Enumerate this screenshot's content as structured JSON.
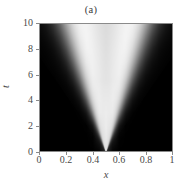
{
  "figure": {
    "panel_label": "(a)",
    "background_color": "#ffffff",
    "axis_color": "#8a8a8a",
    "text_color": "#4a4a4a"
  },
  "axes": {
    "xlabel": "x",
    "ylabel": "t",
    "xticks": [
      "0",
      "0.2",
      "0.4",
      "0.6",
      "0.8",
      "1"
    ],
    "xtick_values": [
      0,
      0.2,
      0.4,
      0.6,
      0.8,
      1
    ],
    "yticks": [
      "0",
      "2",
      "4",
      "6",
      "8",
      "10"
    ],
    "ytick_values": [
      0,
      2,
      4,
      6,
      8,
      10
    ],
    "xlim": [
      0,
      1
    ],
    "ylim": [
      0,
      10
    ]
  },
  "chart_data": {
    "type": "heatmap",
    "title": "(a)",
    "xlabel": "x",
    "ylabel": "t",
    "xlim": [
      0,
      1
    ],
    "ylim": [
      0,
      10
    ],
    "grid": false,
    "legend": "none",
    "colormap": "gray",
    "colormap_low": "#000000",
    "colormap_high": "#ffffff",
    "value_range": [
      0,
      1
    ],
    "apex": {
      "x": 0.5,
      "t": 0.0
    },
    "cone_half_width_slope": 0.038,
    "x": [
      0,
      0.05,
      0.1,
      0.15,
      0.2,
      0.25,
      0.3,
      0.35,
      0.4,
      0.45,
      0.5,
      0.55,
      0.6,
      0.65,
      0.7,
      0.75,
      0.8,
      0.85,
      0.9,
      0.95,
      1
    ],
    "t": [
      0,
      1,
      2,
      3,
      4,
      5,
      6,
      7,
      8,
      9,
      10
    ],
    "z": [
      [
        0.0,
        0.0,
        0.0,
        0.0,
        0.0,
        0.0,
        0.0,
        0.0,
        0.0,
        0.05,
        0.55,
        0.05,
        0.0,
        0.0,
        0.0,
        0.0,
        0.0,
        0.0,
        0.0,
        0.0,
        0.0
      ],
      [
        0.0,
        0.0,
        0.0,
        0.0,
        0.0,
        0.0,
        0.0,
        0.0,
        0.02,
        0.3,
        0.75,
        0.3,
        0.02,
        0.0,
        0.0,
        0.0,
        0.0,
        0.0,
        0.0,
        0.0,
        0.0
      ],
      [
        0.0,
        0.0,
        0.0,
        0.0,
        0.0,
        0.0,
        0.0,
        0.01,
        0.12,
        0.55,
        0.88,
        0.55,
        0.12,
        0.01,
        0.0,
        0.0,
        0.0,
        0.0,
        0.0,
        0.0,
        0.0
      ],
      [
        0.0,
        0.0,
        0.0,
        0.0,
        0.0,
        0.0,
        0.01,
        0.08,
        0.38,
        0.78,
        0.95,
        0.78,
        0.38,
        0.08,
        0.01,
        0.0,
        0.0,
        0.0,
        0.0,
        0.0,
        0.0
      ],
      [
        0.0,
        0.0,
        0.0,
        0.0,
        0.0,
        0.01,
        0.06,
        0.26,
        0.62,
        0.9,
        0.98,
        0.9,
        0.62,
        0.26,
        0.06,
        0.01,
        0.0,
        0.0,
        0.0,
        0.0,
        0.0
      ],
      [
        0.0,
        0.0,
        0.0,
        0.0,
        0.01,
        0.04,
        0.18,
        0.48,
        0.8,
        0.96,
        1.0,
        0.96,
        0.8,
        0.48,
        0.18,
        0.04,
        0.01,
        0.0,
        0.0,
        0.0,
        0.0
      ],
      [
        0.0,
        0.0,
        0.0,
        0.01,
        0.03,
        0.13,
        0.36,
        0.68,
        0.92,
        1.0,
        0.99,
        1.0,
        0.92,
        0.68,
        0.36,
        0.13,
        0.03,
        0.01,
        0.0,
        0.0,
        0.0
      ],
      [
        0.0,
        0.0,
        0.01,
        0.02,
        0.09,
        0.28,
        0.56,
        0.84,
        0.98,
        1.0,
        0.96,
        1.0,
        0.98,
        0.84,
        0.56,
        0.28,
        0.09,
        0.02,
        0.01,
        0.0,
        0.0
      ],
      [
        0.0,
        0.0,
        0.01,
        0.06,
        0.2,
        0.45,
        0.74,
        0.94,
        1.0,
        0.99,
        0.93,
        0.99,
        1.0,
        0.94,
        0.74,
        0.45,
        0.2,
        0.06,
        0.01,
        0.0,
        0.0
      ],
      [
        0.0,
        0.01,
        0.04,
        0.14,
        0.35,
        0.63,
        0.87,
        0.99,
        1.0,
        0.96,
        0.9,
        0.96,
        1.0,
        0.99,
        0.87,
        0.63,
        0.35,
        0.14,
        0.04,
        0.01,
        0.0
      ],
      [
        0.0,
        0.02,
        0.1,
        0.27,
        0.52,
        0.78,
        0.95,
        1.0,
        0.99,
        0.93,
        0.87,
        0.93,
        0.99,
        1.0,
        0.95,
        0.78,
        0.52,
        0.27,
        0.1,
        0.02,
        0.0
      ]
    ]
  }
}
